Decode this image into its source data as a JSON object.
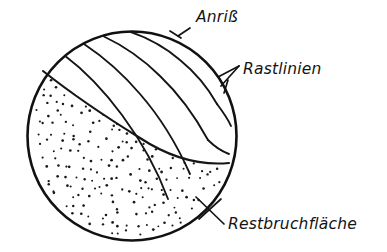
{
  "figure": {
    "kind": "technical-line-drawing",
    "background_color": "#ffffff",
    "ink_color": "#141414",
    "circle": {
      "center_x": 132,
      "center_y": 136,
      "radius": 105
    }
  },
  "labels": {
    "crack_initiation": "Anriß",
    "beach_marks": "Rastlinien",
    "final_fracture": "Restbruchfläche"
  },
  "label_positions": {
    "crack_initiation": {
      "x": 196,
      "y": 22
    },
    "beach_marks": {
      "x": 243,
      "y": 74
    },
    "final_fracture": {
      "x": 228,
      "y": 229
    }
  },
  "regions": [
    {
      "name": "crack-growth-zone",
      "label_ref": "beach_marks",
      "fill": "plain",
      "description": "smooth upper zone crossed by nested arrest lines"
    },
    {
      "name": "final-fracture-zone",
      "label_ref": "final_fracture",
      "fill": "stipple",
      "description": "stippled lower-left zone of residual rupture"
    }
  ],
  "arcs": {
    "count": 4,
    "origin_x": 175,
    "origin_y": 33,
    "description": "concentric arrest lines expanding from the crack origin"
  },
  "chart_data": {
    "type": "diagram",
    "annotations": [
      {
        "text": "Anriß",
        "points_to": "crack origin notch on upper circle edge"
      },
      {
        "text": "Rastlinien",
        "points_to": "nested arcs near right circle edge"
      },
      {
        "text": "Restbruchfläche",
        "points_to": "stippled lower-left region"
      }
    ]
  }
}
